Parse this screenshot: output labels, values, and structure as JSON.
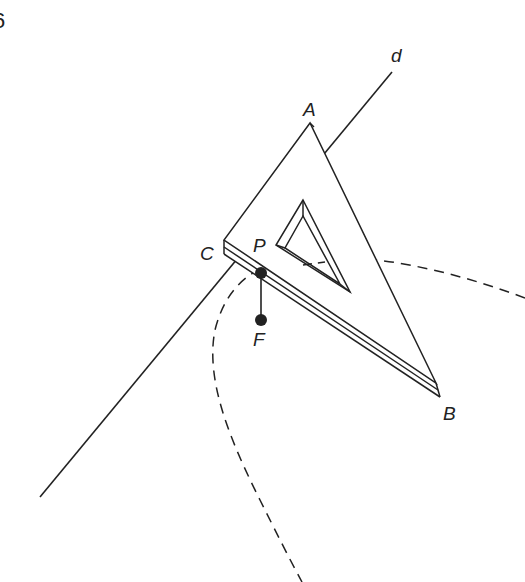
{
  "figure": {
    "corner_glyph": "6",
    "labels": {
      "d": "d",
      "A": "A",
      "B": "B",
      "C": "C",
      "P": "P",
      "F": "F"
    },
    "colors": {
      "stroke": "#222222",
      "background": "#ffffff"
    },
    "elements": [
      "line d (directrix)",
      "set square triangle ABC with thickness",
      "inner triangular cutout",
      "point P on edge CB",
      "point F (focus)",
      "segment PF (string)",
      "dashed parabola curve"
    ]
  }
}
